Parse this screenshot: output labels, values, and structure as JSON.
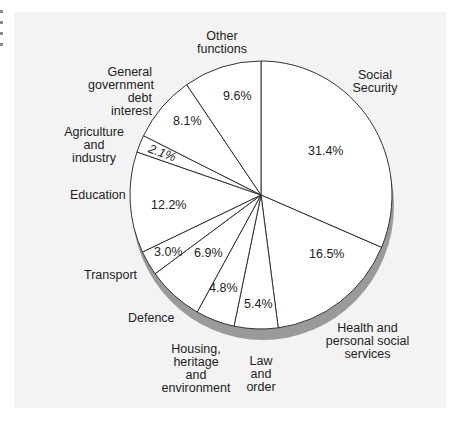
{
  "chart_data": {
    "type": "pie",
    "title": "",
    "start_angle": "12 o'clock",
    "direction": "clockwise",
    "style": "3D pie with drop shadow",
    "slices": [
      {
        "label": "Social Security",
        "value": 31.4,
        "value_label": "31.4%"
      },
      {
        "label": "Health and personal social services",
        "value": 16.5,
        "value_label": "16.5%"
      },
      {
        "label": "Law and order",
        "value": 5.4,
        "value_label": "5.4%"
      },
      {
        "label": "Housing, heritage and environment",
        "value": 4.8,
        "value_label": "4.8%"
      },
      {
        "label": "Defence",
        "value": 6.9,
        "value_label": "6.9%"
      },
      {
        "label": "Transport",
        "value": 3.0,
        "value_label": "3.0%"
      },
      {
        "label": "Education",
        "value": 12.2,
        "value_label": "12.2%"
      },
      {
        "label": "Agriculture and industry",
        "value": 2.1,
        "value_label": "2.1%"
      },
      {
        "label": "General government debt interest",
        "value": 8.1,
        "value_label": "8.1%"
      },
      {
        "label": "Other functions",
        "value": 9.6,
        "value_label": "9.6%"
      }
    ]
  },
  "labels": {
    "social_security": "Social\nSecurity",
    "health": "Health and\npersonal social\nservices",
    "law": "Law\nand\norder",
    "housing": "Housing,\nheritage\nand\nenvironment",
    "defence": "Defence",
    "transport": "Transport",
    "education": "Education",
    "agriculture": "Agriculture and\nindustry",
    "debt": "General\ngovernment\ndebt interest",
    "other": "Other\nfunctions"
  },
  "values": {
    "social_security": "31.4%",
    "health": "16.5%",
    "law": "5.4%",
    "housing": "4.8%",
    "defence": "6.9%",
    "transport": "3.0%",
    "education": "12.2%",
    "agriculture": "2.1%",
    "debt": "8.1%",
    "other": "9.6%"
  },
  "colors": {
    "panel": "#f3f3f3",
    "slice_fill": "#ffffff",
    "outline": "#333333",
    "shadow": "#9a9a9a"
  }
}
